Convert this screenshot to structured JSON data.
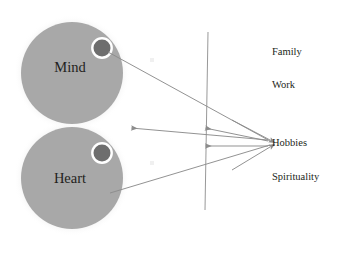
{
  "diagram": {
    "background_color": "#ffffff",
    "circle_fill": "#a8a8a8",
    "circle_halo": "#f2f2f2",
    "inner_dot_fill": "#6e6e6e",
    "inner_dot_ring": "#ffffff",
    "line_color": "#8c8c8c",
    "text_color": "#231f20",
    "nodes": {
      "mind": {
        "label": "Mind",
        "cx": 72,
        "cy": 73,
        "r": 51,
        "dot_cx": 102,
        "dot_cy": 48,
        "dot_r": 8.5
      },
      "heart": {
        "label": "Heart",
        "cx": 72,
        "cy": 178,
        "r": 51,
        "dot_cx": 102,
        "dot_cy": 153,
        "dot_r": 8.5
      }
    },
    "hub": {
      "label": "Hobbies",
      "x": 272,
      "y": 143
    },
    "side_labels": [
      {
        "label": "Family",
        "x": 272,
        "y": 55
      },
      {
        "label": "Work",
        "x": 272,
        "y": 88
      },
      {
        "label": "Spirituality",
        "x": 272,
        "y": 180
      }
    ],
    "divider_line": {
      "x1": 208,
      "y1": 32,
      "x2": 205,
      "y2": 210
    },
    "connectors": [
      {
        "name": "hub-to-mind-dot",
        "x1": 270,
        "y1": 141,
        "x2": 108,
        "y2": 52,
        "arrow": "none"
      },
      {
        "name": "hub-to-heart-inner",
        "x1": 270,
        "y1": 145,
        "x2": 110,
        "y2": 193,
        "arrow": "none"
      },
      {
        "name": "hub-to-gap-left",
        "x1": 268,
        "y1": 140,
        "x2": 131,
        "y2": 128,
        "arrow": "start"
      },
      {
        "name": "hub-to-divider-upper",
        "x1": 268,
        "y1": 141,
        "x2": 205,
        "y2": 128,
        "arrow": "start"
      },
      {
        "name": "hub-to-divider-lower",
        "x1": 268,
        "y1": 146,
        "x2": 205,
        "y2": 146,
        "arrow": "start"
      },
      {
        "name": "inbound-upper",
        "x1": 232,
        "y1": 120,
        "x2": 270,
        "y2": 140,
        "arrow": "end"
      },
      {
        "name": "inbound-lower",
        "x1": 232,
        "y1": 170,
        "x2": 270,
        "y2": 147,
        "arrow": "end"
      }
    ],
    "faint_marks": [
      {
        "name": "faint-mark-upper",
        "x": 152,
        "y": 60
      },
      {
        "name": "faint-mark-lower",
        "x": 152,
        "y": 163
      }
    ]
  }
}
